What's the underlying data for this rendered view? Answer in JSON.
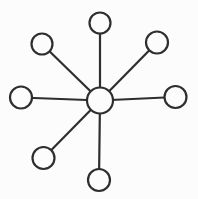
{
  "diagram": {
    "type": "hub-and-spoke",
    "background_color": "#fcfcfc",
    "stroke_color": "#2e2e2e",
    "node_fill_color": "#fcfcfc",
    "stroke_width": 2.2,
    "hub": {
      "id": "hub",
      "x": 100,
      "y": 100.5,
      "r": 13
    },
    "nodes": [
      {
        "id": "node-north",
        "x": 100,
        "y": 23,
        "r": 10.5
      },
      {
        "id": "node-north-east",
        "x": 157,
        "y": 42.5,
        "r": 11
      },
      {
        "id": "node-east",
        "x": 175.5,
        "y": 97,
        "r": 11
      },
      {
        "id": "node-south",
        "x": 99,
        "y": 180,
        "r": 11
      },
      {
        "id": "node-south-west",
        "x": 43.5,
        "y": 158,
        "r": 11
      },
      {
        "id": "node-west",
        "x": 21,
        "y": 97.5,
        "r": 11
      },
      {
        "id": "node-north-west",
        "x": 42,
        "y": 44,
        "r": 10.5
      }
    ],
    "edges": [
      {
        "from": "hub",
        "to": "node-north"
      },
      {
        "from": "hub",
        "to": "node-north-east"
      },
      {
        "from": "hub",
        "to": "node-east"
      },
      {
        "from": "hub",
        "to": "node-south"
      },
      {
        "from": "hub",
        "to": "node-south-west"
      },
      {
        "from": "hub",
        "to": "node-west"
      },
      {
        "from": "hub",
        "to": "node-north-west"
      }
    ],
    "empty_positions": [
      "south-east"
    ]
  }
}
